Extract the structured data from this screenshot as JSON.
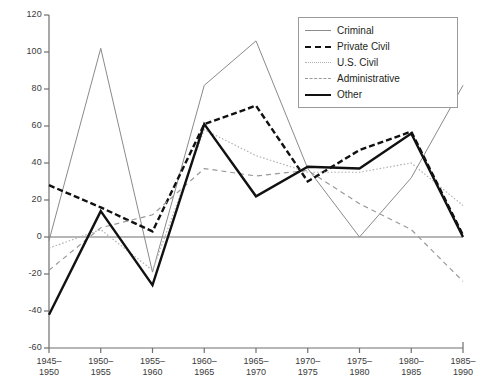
{
  "chart_data": {
    "type": "line",
    "title": "",
    "xlabel": "",
    "ylabel": "",
    "grid": false,
    "legend_position": "top-right",
    "ylim": [
      -60,
      120
    ],
    "yticks": [
      120,
      100,
      80,
      60,
      40,
      20,
      0,
      -20,
      -40,
      -60
    ],
    "ytick_labels": [
      "120",
      "100",
      "80",
      "60",
      "40",
      "20",
      "0",
      "-20",
      "-40",
      "-60"
    ],
    "categories": [
      "1945–\n1950",
      "1950–\n1955",
      "1955–\n1960",
      "1960–\n1965",
      "1965–\n1970",
      "1970–\n1975",
      "1975–\n1980",
      "1980–\n1985",
      "1985–\n1990"
    ],
    "category_lines": [
      [
        "1945–",
        "1950"
      ],
      [
        "1950–",
        "1955"
      ],
      [
        "1955–",
        "1960"
      ],
      [
        "1960–",
        "1965"
      ],
      [
        "1965–",
        "1970"
      ],
      [
        "1970–",
        "1975"
      ],
      [
        "1975–",
        "1980"
      ],
      [
        "1980–",
        "1985"
      ],
      [
        "1985–",
        "1990"
      ]
    ],
    "series": [
      {
        "name": "Criminal",
        "style": "thin-solid",
        "color": "#8a8a8a",
        "width": 1,
        "dash": "none",
        "values": [
          -2,
          102,
          -19,
          82,
          106,
          37,
          0,
          32,
          82
        ]
      },
      {
        "name": "Private Civil",
        "style": "bold-dashed",
        "color": "#111111",
        "width": 2.4,
        "dash": "6,3",
        "values": [
          28,
          16,
          3,
          61,
          71,
          30,
          47,
          57,
          1
        ]
      },
      {
        "name": "U.S. Civil",
        "style": "dotted",
        "color": "#b0b0b0",
        "width": 1.2,
        "dash": "1.5,2",
        "values": [
          -6,
          4,
          -18,
          58,
          44,
          35,
          35,
          40,
          17
        ]
      },
      {
        "name": "Administrative",
        "style": "dashed",
        "color": "#9a9a9a",
        "width": 1.2,
        "dash": "5,4",
        "values": [
          -18,
          5,
          12,
          37,
          33,
          36,
          18,
          4,
          -24
        ]
      },
      {
        "name": "Other",
        "style": "bold-solid",
        "color": "#111111",
        "width": 2.4,
        "dash": "none",
        "values": [
          -42,
          14,
          -26,
          61,
          22,
          38,
          37,
          56,
          0
        ]
      }
    ]
  },
  "legend": {
    "entries": [
      {
        "label": "Criminal",
        "swatch": "sw-criminal"
      },
      {
        "label": "Private Civil",
        "swatch": "sw-private"
      },
      {
        "label": "U.S. Civil",
        "swatch": "sw-uscivil"
      },
      {
        "label": "Administrative",
        "swatch": "sw-admin"
      },
      {
        "label": "Other",
        "swatch": "sw-other"
      }
    ]
  },
  "colors": {
    "axis": "#6f6f6f",
    "text": "#231f20",
    "background": "#ffffff"
  }
}
